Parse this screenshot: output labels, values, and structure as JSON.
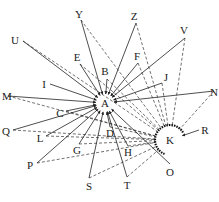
{
  "diagram": {
    "type": "network",
    "hub_nodes": [
      "A",
      "K"
    ],
    "nodes": [
      {
        "id": "A",
        "label": "A"
      },
      {
        "id": "K",
        "label": "K"
      },
      {
        "id": "Y",
        "label": "Y"
      },
      {
        "id": "U",
        "label": "U"
      },
      {
        "id": "Z",
        "label": "Z"
      },
      {
        "id": "V",
        "label": "V"
      },
      {
        "id": "E",
        "label": "E"
      },
      {
        "id": "F",
        "label": "F"
      },
      {
        "id": "B",
        "label": "B"
      },
      {
        "id": "J",
        "label": "J"
      },
      {
        "id": "I",
        "label": "I"
      },
      {
        "id": "M",
        "label": "M"
      },
      {
        "id": "N",
        "label": "N"
      },
      {
        "id": "C",
        "label": "C"
      },
      {
        "id": "Q",
        "label": "Q"
      },
      {
        "id": "L",
        "label": "L"
      },
      {
        "id": "D",
        "label": "D"
      },
      {
        "id": "R",
        "label": "R"
      },
      {
        "id": "G",
        "label": "G"
      },
      {
        "id": "H",
        "label": "H"
      },
      {
        "id": "P",
        "label": "P"
      },
      {
        "id": "O",
        "label": "O"
      },
      {
        "id": "S",
        "label": "S"
      },
      {
        "id": "T",
        "label": "T"
      }
    ],
    "solid_edges_to_A": [
      "Y",
      "U",
      "Z",
      "V",
      "E",
      "F",
      "B",
      "J",
      "I",
      "M",
      "N",
      "C",
      "Q",
      "L",
      "D",
      "G",
      "H",
      "P",
      "S",
      "T",
      "O"
    ],
    "dashed_edges_to_K": [
      "Y",
      "U",
      "Z",
      "V",
      "E",
      "F",
      "B",
      "J",
      "M",
      "C",
      "Q",
      "L",
      "D",
      "G",
      "H",
      "P",
      "S",
      "T",
      "N"
    ],
    "solid_edges_to_K": [
      "R"
    ]
  }
}
